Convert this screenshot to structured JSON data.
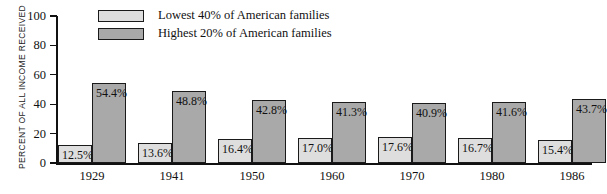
{
  "chart_data": {
    "type": "bar",
    "title": "",
    "xlabel": "",
    "ylabel": "PERCENT OF ALL INCOME RECEIVED",
    "ylim": [
      0,
      100
    ],
    "yticks": [
      0,
      20,
      40,
      60,
      80,
      100
    ],
    "ytick_labels": [
      "0",
      "20",
      "40",
      "60",
      "80",
      "100"
    ],
    "grid": false,
    "legend_position": "top-center",
    "categories": [
      "1929",
      "1941",
      "1950",
      "1960",
      "1970",
      "1980",
      "1986"
    ],
    "series": [
      {
        "name": "Lowest 40% of American families",
        "color": "#dedede",
        "values": [
          12.5,
          13.6,
          16.4,
          17.0,
          17.6,
          16.7,
          15.4
        ],
        "labels": [
          "12.5%",
          "13.6%",
          "16.4%",
          "17.0%",
          "17.6%",
          "16.7%",
          "15.4%"
        ]
      },
      {
        "name": "Highest 20% of American families",
        "color": "#a9a9a9",
        "values": [
          54.4,
          48.8,
          42.8,
          41.3,
          40.9,
          41.6,
          43.7
        ],
        "labels": [
          "54.4%",
          "48.8%",
          "42.8%",
          "41.3%",
          "40.9%",
          "41.6%",
          "43.7%"
        ]
      }
    ]
  },
  "legend": {
    "items": [
      {
        "label": "Lowest 40% of American families",
        "swatch": "light-gray-swatch"
      },
      {
        "label": "Highest 20% of American families",
        "swatch": "dark-gray-swatch"
      }
    ]
  },
  "axis": {
    "y_title": "PERCENT OF ALL INCOME RECEIVED",
    "y_ticks": [
      "100",
      "80",
      "60",
      "40",
      "20",
      "0"
    ],
    "x_ticks": [
      "1929",
      "1941",
      "1950",
      "1960",
      "1970",
      "1980",
      "1986"
    ]
  },
  "colors": {
    "lowest40_fill": "#dedede",
    "highest20_fill": "#a9a9a9",
    "outline": "#1a1a1a",
    "background": "#ffffff"
  }
}
